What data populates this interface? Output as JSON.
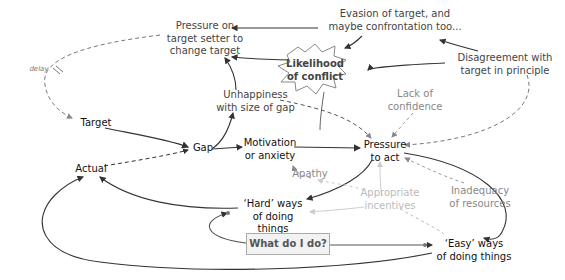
{
  "diagram": {
    "type": "causal-loop",
    "nodes": {
      "pressure_setter": "Pressure on\ntarget setter to\nchange target",
      "evasion": "Evasion of target, and\nmaybe confrontation too...",
      "conflict": "Likelihood\nof conflict",
      "disagreement": "Disagreement with\ntarget in principle",
      "unhappiness": "Unhappiness\nwith size of gap",
      "lack_confidence": "Lack of\nconfidence",
      "target": "Target",
      "gap": "Gap",
      "motivation": "Motivation\nor anxiety",
      "pressure_act": "Pressure\nto act",
      "actual": "Actual",
      "apathy": "Apathy",
      "incentives": "Appropriate\nincentives",
      "inadequacy": "Inadequacy\nof resources",
      "hard": "‘Hard’ ways\nof doing things",
      "easy": "‘Easy’ ways\nof doing things",
      "question": "What do I do?",
      "delay": "delay"
    },
    "colors": {
      "line_dark": "#333333",
      "line_grey": "#999999",
      "line_light": "#cccccc",
      "box_fill": "#f2f2f2"
    }
  }
}
